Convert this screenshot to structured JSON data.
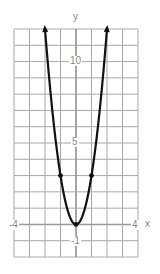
{
  "chart_data": {
    "type": "line",
    "title": "",
    "function": "y = 3x^2",
    "xlabel": "x",
    "ylabel": "y",
    "xlim": [
      -4,
      4
    ],
    "ylim": [
      -2,
      12
    ],
    "grid": true,
    "grid_step": 1,
    "x_tick_labels": [
      "-4",
      "4"
    ],
    "y_tick_labels": [
      "10",
      "5",
      "-1"
    ],
    "points": [
      {
        "x": -1,
        "y": 3
      },
      {
        "x": 0,
        "y": 0
      },
      {
        "x": 1,
        "y": 3
      }
    ],
    "curve_endpoints_with_arrows": [
      {
        "x": -2,
        "y": 12
      },
      {
        "x": 2,
        "y": 12
      }
    ]
  },
  "labels": {
    "x_axis": "x",
    "y_axis": "y",
    "x_min": "-4",
    "x_max": "4",
    "y_ten": "10",
    "y_five": "5",
    "y_neg_one": "-1"
  },
  "colors": {
    "grid": "#a8a8a8",
    "axis": "#9a9a9a",
    "curve": "#111111",
    "label": "#888888"
  }
}
